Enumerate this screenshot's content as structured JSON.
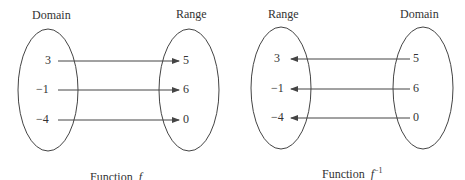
{
  "diagrams": [
    {
      "caption": "Function",
      "function_symbol": "f",
      "superscript": "",
      "left_set_label": "Domain",
      "right_set_label": "Range",
      "left_values": [
        "3",
        "−1",
        "−4"
      ],
      "right_values": [
        "5",
        "6",
        "0"
      ],
      "arrow_direction": "left-to-right"
    },
    {
      "caption": "Function",
      "function_symbol": "f",
      "superscript": "−1",
      "left_set_label": "Range",
      "right_set_label": "Domain",
      "left_values": [
        "3",
        "−1",
        "−4"
      ],
      "right_values": [
        "5",
        "6",
        "0"
      ],
      "arrow_direction": "right-to-left"
    }
  ],
  "colors": {
    "stroke": "#444444",
    "text": "#333333",
    "background": "#ffffff"
  }
}
